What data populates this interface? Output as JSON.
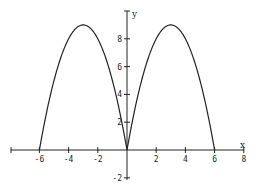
{
  "chart_data": {
    "type": "line",
    "title": "",
    "xlabel": "x",
    "ylabel": "y",
    "xlim": [
      -8,
      8
    ],
    "ylim": [
      -2,
      10
    ],
    "grid": false,
    "x_ticks": [
      -6,
      -4,
      -2,
      2,
      4,
      6,
      8
    ],
    "x_tick_labels": [
      "-6",
      "-4",
      "-2",
      "2",
      "4",
      "6",
      "8"
    ],
    "y_ticks": [
      -2,
      2,
      4,
      6,
      8
    ],
    "y_tick_labels": [
      "-2",
      "2",
      "4",
      "6",
      "8"
    ],
    "series": [
      {
        "name": "y = 6|x| - x^2",
        "x": [
          -6,
          -5,
          -4,
          -3,
          -2,
          -1,
          0,
          1,
          2,
          3,
          4,
          5,
          6
        ],
        "values": [
          0,
          5,
          8,
          9,
          8,
          5,
          0,
          5,
          8,
          9,
          8,
          5,
          0
        ],
        "color": "#222222"
      }
    ]
  }
}
